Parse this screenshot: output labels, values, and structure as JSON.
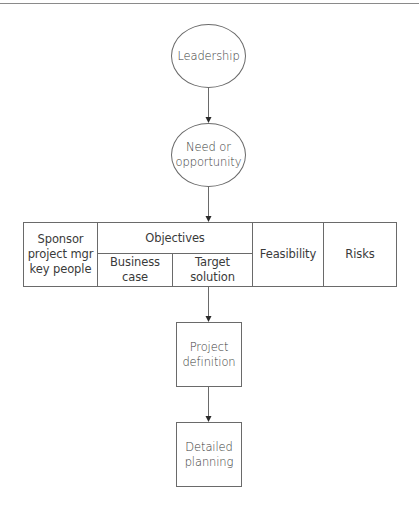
{
  "diagram": {
    "type": "flowchart",
    "colors": {
      "stroke": "#6a6a6a",
      "text": "#3a3a3a",
      "background": "#ffffff"
    },
    "nodes": {
      "leadership": {
        "shape": "ellipse",
        "label": "Leadership"
      },
      "need": {
        "shape": "ellipse",
        "label": "Need or\nopportunity"
      },
      "sponsor": {
        "shape": "table-cell",
        "label": "Sponsor\nproject mgr\nkey people"
      },
      "objectives": {
        "shape": "table-cell",
        "label": "Objectives",
        "children": [
          {
            "label": "Business case"
          },
          {
            "label": "Target solution"
          }
        ]
      },
      "feasibility": {
        "shape": "table-cell",
        "label": "Feasibility"
      },
      "risks": {
        "shape": "table-cell",
        "label": "Risks"
      },
      "project_definition": {
        "shape": "rectangle",
        "label": "Project\ndefinition"
      },
      "detailed_planning": {
        "shape": "rectangle",
        "label": "Detailed\nplanning"
      }
    },
    "edges": [
      {
        "from": "Leadership",
        "to": "Need or opportunity"
      },
      {
        "from": "Need or opportunity",
        "to": "Objectives row"
      },
      {
        "from": "Objectives row",
        "to": "Project definition"
      },
      {
        "from": "Project definition",
        "to": "Detailed planning"
      }
    ]
  }
}
